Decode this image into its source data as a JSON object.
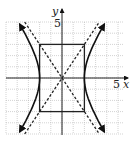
{
  "chart_data": {
    "type": "line",
    "title": "",
    "xlabel": "x",
    "ylabel": "y",
    "x_tick_labels": [
      "5"
    ],
    "y_tick_labels": [
      "5"
    ],
    "xlim": [
      -5,
      5.5
    ],
    "ylim": [
      -5,
      5
    ],
    "grid": true,
    "grid_step": 1,
    "central_rectangle": {
      "x_min": -2,
      "x_max": 2,
      "y_min": -3,
      "y_max": 3
    },
    "vertices": [
      [
        -2,
        0
      ],
      [
        2,
        0
      ]
    ],
    "asymptotes": [
      {
        "equation": "y = 1.5x",
        "style": "dashed",
        "from": [
          -3.33,
          -5
        ],
        "to": [
          3.33,
          5
        ]
      },
      {
        "equation": "y = -1.5x",
        "style": "dashed",
        "from": [
          -3.33,
          5
        ],
        "to": [
          3.33,
          -5
        ]
      }
    ],
    "series": [
      {
        "name": "right-branch",
        "x": [
          3.77,
          3.33,
          2.83,
          2.4,
          2.11,
          2.0,
          2.11,
          2.4,
          2.83,
          3.33,
          3.77
        ],
        "y": [
          4.8,
          4,
          3,
          2,
          1,
          0,
          -1,
          -2,
          -3,
          -4,
          -4.8
        ]
      },
      {
        "name": "left-branch",
        "x": [
          -3.77,
          -3.33,
          -2.83,
          -2.4,
          -2.11,
          -2.0,
          -2.11,
          -2.4,
          -2.83,
          -3.33,
          -3.77
        ],
        "y": [
          4.8,
          4,
          3,
          2,
          1,
          0,
          -1,
          -2,
          -3,
          -4,
          -4.8
        ]
      }
    ]
  },
  "labels": {
    "x_axis": "x",
    "y_axis": "y",
    "x_tick": "5",
    "y_tick": "5"
  }
}
